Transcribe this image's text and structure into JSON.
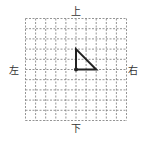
{
  "labels": {
    "top": "上",
    "bottom": "下",
    "left": "左",
    "right": "右"
  },
  "grid": {
    "columns": 10,
    "rows": 10,
    "line_style": "dashed",
    "line_color": "#7a7a7a"
  },
  "shape": {
    "type": "right-triangle",
    "vertices_grid": [
      [
        5,
        3
      ],
      [
        5,
        5
      ],
      [
        7,
        5
      ]
    ],
    "rotation_point_grid": [
      5,
      5
    ],
    "stroke_color": "#222222"
  }
}
